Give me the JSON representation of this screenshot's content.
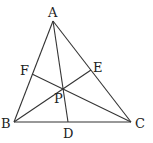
{
  "diagram": {
    "type": "triangle-cevians",
    "points": {
      "A": {
        "label": "A",
        "x": 53,
        "y": 21,
        "lx": 48,
        "ly": 17
      },
      "B": {
        "label": "B",
        "x": 14,
        "y": 122,
        "lx": 1,
        "ly": 128
      },
      "C": {
        "label": "C",
        "x": 131,
        "y": 122,
        "lx": 135,
        "ly": 128
      },
      "D": {
        "label": "D",
        "x": 68,
        "y": 122,
        "lx": 63,
        "ly": 138
      },
      "E": {
        "label": "E",
        "x": 91,
        "y": 70,
        "lx": 93,
        "ly": 72
      },
      "F": {
        "label": "F",
        "x": 32,
        "y": 74,
        "lx": 20,
        "ly": 75
      },
      "P": {
        "label": "P",
        "x": 62,
        "y": 88,
        "lx": 54,
        "ly": 103
      }
    },
    "segments": [
      [
        "A",
        "B"
      ],
      [
        "B",
        "C"
      ],
      [
        "C",
        "A"
      ],
      [
        "A",
        "D"
      ],
      [
        "B",
        "E"
      ],
      [
        "C",
        "F"
      ]
    ],
    "colors": {
      "line": "#333333",
      "label": "#222222"
    }
  }
}
